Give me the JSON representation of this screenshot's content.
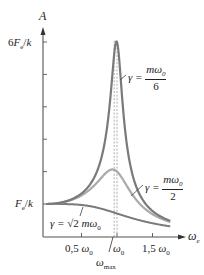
{
  "chart_data": {
    "type": "line",
    "title": "",
    "xlabel": "ωe",
    "ylabel": "A",
    "x_axis": {
      "variable": "ω_e",
      "ticks": [
        {
          "value": 0.5,
          "label": "0,5 ω0"
        },
        {
          "value": 1.0,
          "label": "ω0"
        },
        {
          "value": 1.5,
          "label": "1,5 ω0"
        }
      ],
      "annotation": {
        "value": 0.96,
        "label": "ω_max"
      },
      "xlim": [
        0,
        1.75
      ]
    },
    "y_axis": {
      "unit": "F0/k",
      "ticks": [
        1,
        2,
        3,
        4,
        5,
        6
      ],
      "tick_labels": [
        {
          "value": 1,
          "label": "Fe/k"
        },
        {
          "value": 6,
          "label": "6Fe/k"
        }
      ],
      "ylim": [
        0,
        6.5
      ]
    },
    "grid": false,
    "legend": "inline annotations",
    "series": [
      {
        "name": "γ = mω0/6",
        "damping_ratio_gamma_over_m_omega0": 0.1667,
        "peak": 6.0,
        "peak_at": 1.0,
        "color": "#7a7a7a",
        "width": 2.2
      },
      {
        "name": "γ = mω0/2",
        "damping_ratio_gamma_over_m_omega0": 0.5,
        "peak": 2.07,
        "peak_at": 0.94,
        "color": "#a9a9a9",
        "width": 2.2
      },
      {
        "name": "γ = √2 mω0",
        "damping_ratio_gamma_over_m_omega0": 1.4142,
        "peak": 1.0,
        "peak_at": 0.0,
        "color": "#7a7a7a",
        "width": 2.0
      }
    ],
    "formula": "A = (Fe/k) / sqrt((1 - r^2)^2 + (γ r / (m ω0))^2), r = ωe/ω0"
  },
  "labels": {
    "y_axis_name": "A",
    "y_top": {
      "coef": "6",
      "F": "F",
      "sub": "e",
      "slash": "/",
      "k": "k"
    },
    "y_one": {
      "F": "F",
      "sub": "e",
      "slash": "/",
      "k": "k"
    },
    "x_axis_name": {
      "w": "ω",
      "sub": "e"
    },
    "x_ticks": [
      {
        "coef": "0,5",
        "w": "ω",
        "sub": "0"
      },
      {
        "coef": "",
        "w": "ω",
        "sub": "0"
      },
      {
        "coef": "1,5",
        "w": "ω",
        "sub": "0"
      }
    ],
    "omega_max": {
      "w": "ω",
      "sub": "max"
    },
    "curve_labels": [
      {
        "lhs": "γ =",
        "num": "mω",
        "num_sub": "0",
        "den": "6"
      },
      {
        "lhs": "γ =",
        "num": "mω",
        "num_sub": "0",
        "den": "2"
      },
      {
        "lhs": "γ =",
        "rad": "√2",
        "rest": "mω",
        "rest_sub": "0"
      }
    ]
  },
  "colors": {
    "axis": "#8a8a8a",
    "dark_curve": "#7a7a7a",
    "light_curve": "#a9a9a9",
    "dashed": "#9a9a9a",
    "text": "#222222"
  }
}
